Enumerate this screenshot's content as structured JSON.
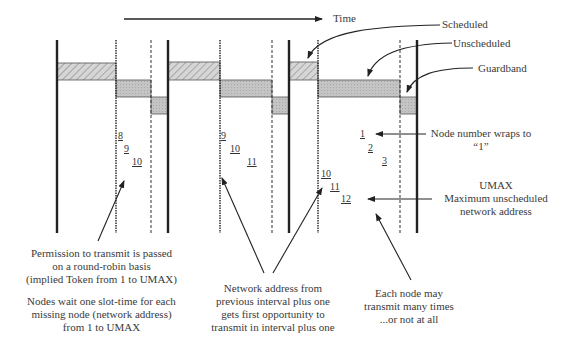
{
  "diagram": {
    "time_axis_label": "Time",
    "legend": {
      "scheduled": "Scheduled",
      "unscheduled": "Unscheduled",
      "guardband": "Guardband"
    },
    "colors": {
      "line": "#222222",
      "scheduled_fill": "#c8c8c8",
      "unscheduled_fill": "#bdbdbd",
      "guardband_fill": "#b5b5b5"
    },
    "intervals": [
      {
        "node_sequence": [
          "8",
          "9",
          "10"
        ]
      },
      {
        "node_sequence": [
          "9",
          "10",
          "11"
        ]
      },
      {
        "node_sequence_unscheduled": [
          "10",
          "11",
          "12"
        ],
        "node_sequence_wrap": [
          "1",
          "2",
          "3"
        ]
      }
    ],
    "annotations": {
      "wrap_line1": "Node number wraps to",
      "wrap_line2": "“1”",
      "umax_line1": "UMAX",
      "umax_line2": "Maximum unscheduled",
      "umax_line3": "network address",
      "perm_line1": "Permission to transmit is passed",
      "perm_line2": "on a round-robin basis",
      "perm_line3": "(implied Token from 1 to UMAX)",
      "wait_line1": "Nodes wait one slot-time for each",
      "wait_line2": "missing node (network address)",
      "wait_line3": "from 1 to UMAX",
      "addr_line1": "Network address from",
      "addr_line2": "previous interval plus one",
      "addr_line3": "gets first opportunity to",
      "addr_line4": "transmit in interval plus one",
      "each_line1": "Each node may",
      "each_line2": "transmit many times",
      "each_line3": "...or not at all"
    }
  }
}
